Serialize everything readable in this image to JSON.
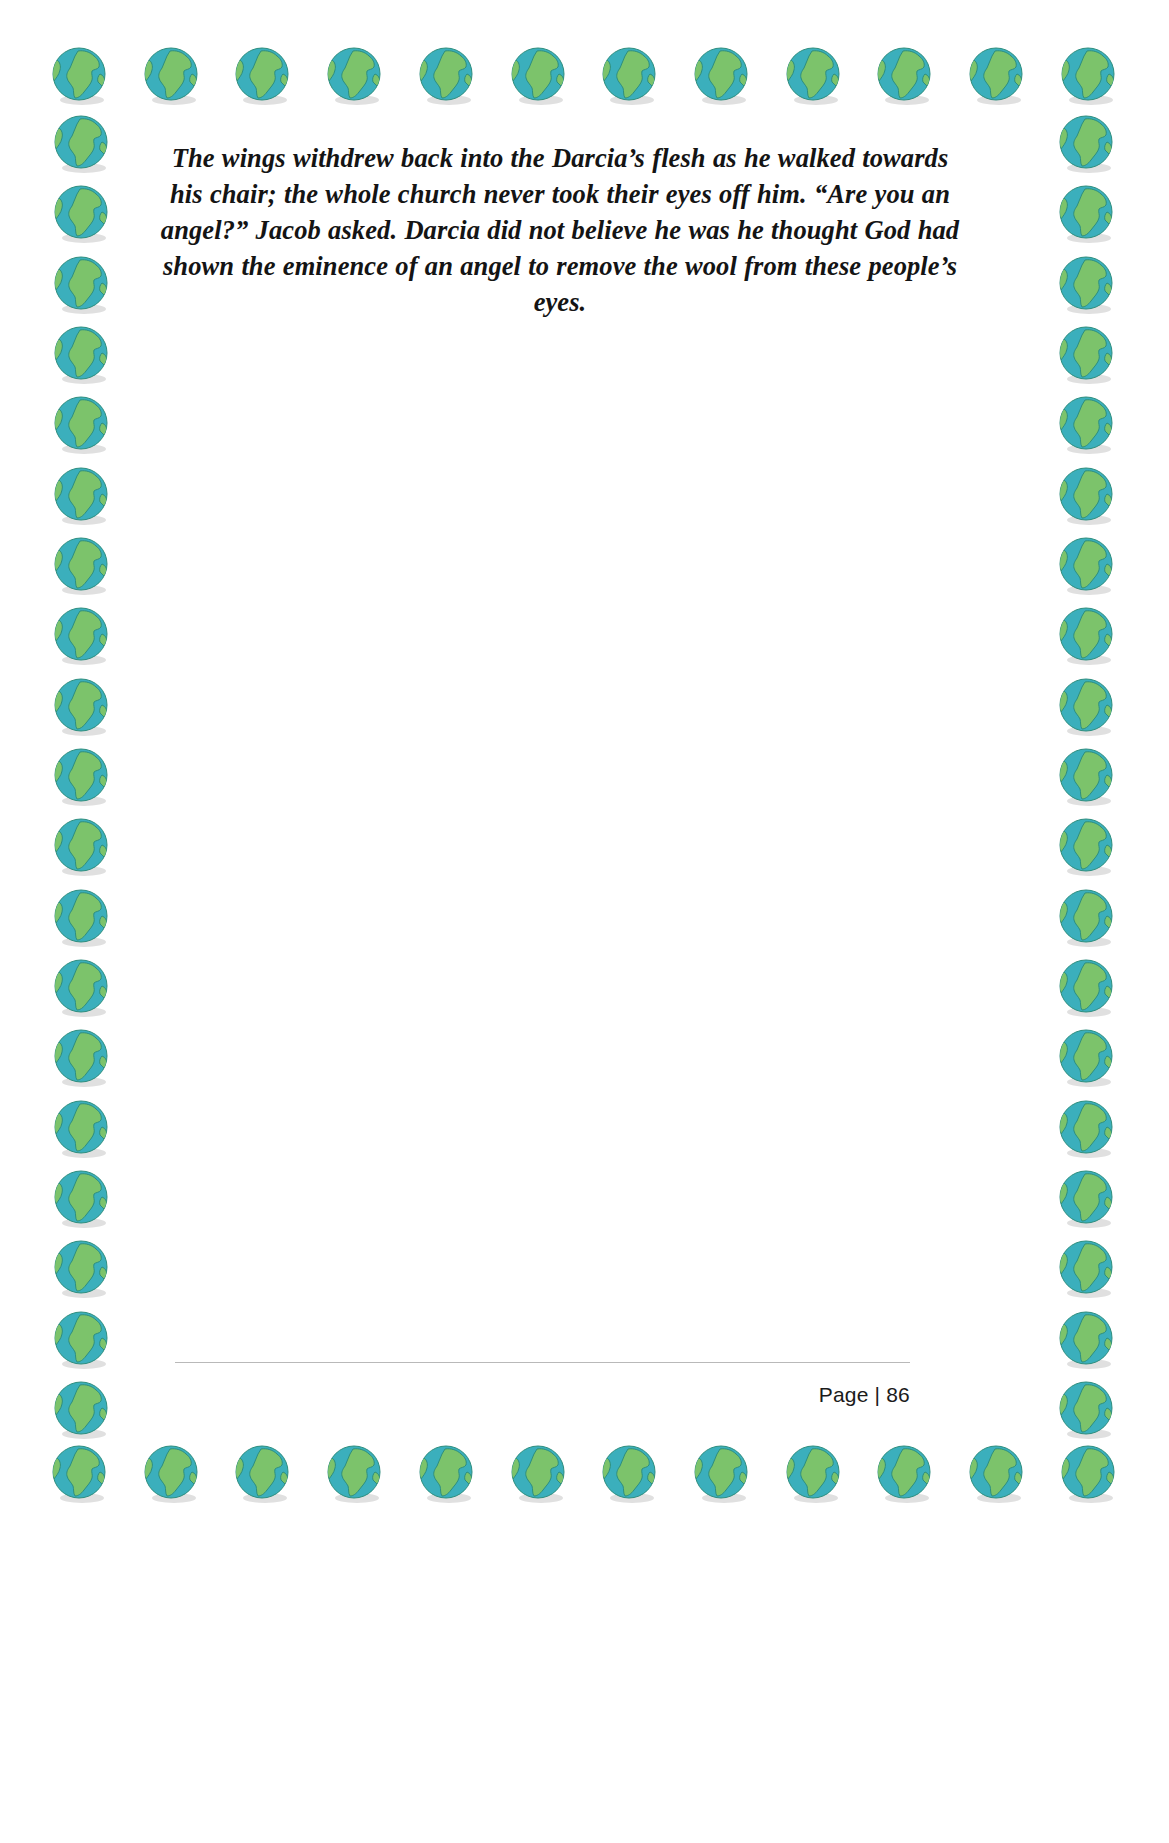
{
  "page": {
    "background_color": "#ffffff",
    "width": 1169,
    "height": 1843
  },
  "border": {
    "motif_icon": "globe-icon",
    "ocean_color": "#3BAFBC",
    "land_color": "#7CC36B",
    "outline_color": "#2E8E7E",
    "shadow_color": "#d5d5d5",
    "top_count": 12,
    "bottom_count": 12,
    "left_count": 19,
    "right_count": 19
  },
  "content": {
    "paragraph": "The wings withdrew back into the Darcia’s flesh as he walked towards his chair; the whole church never took their eyes off him. “Are you an angel?” Jacob asked. Darcia did not believe he was he thought God had shown the eminence of an angel to remove the wool from these people’s eyes.",
    "text_color": "#141414",
    "alignment": "center",
    "style": "bold-italic-serif"
  },
  "footer": {
    "page_label": "Page | 86",
    "rule_color": "#b9b9b9"
  }
}
